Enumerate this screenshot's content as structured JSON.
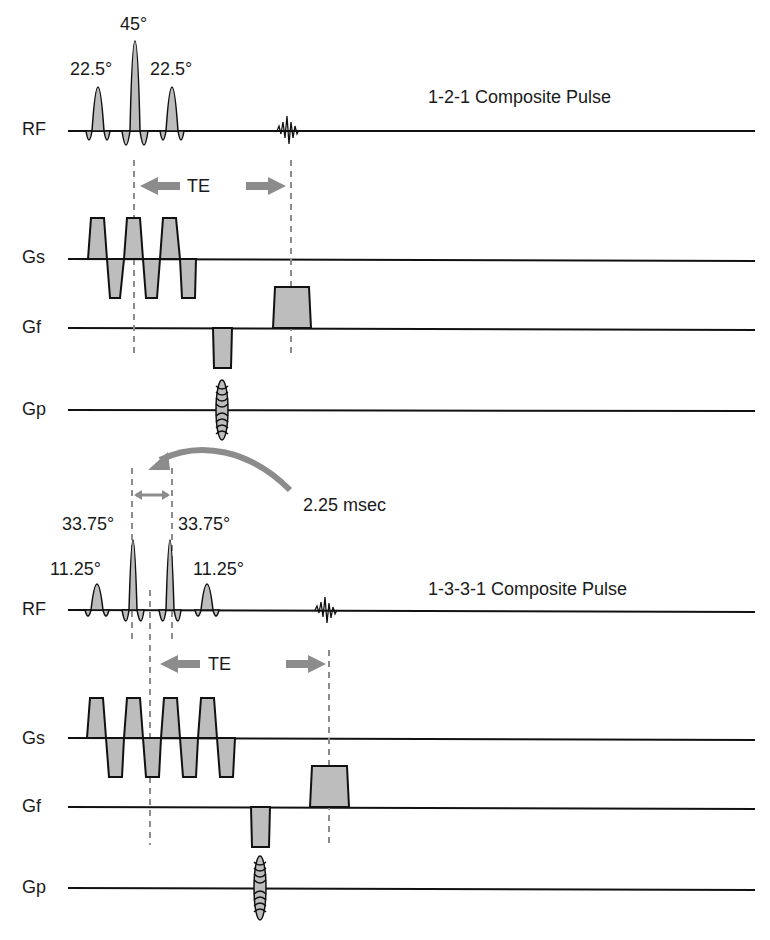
{
  "diagram": {
    "top": {
      "title": "1-2-1 Composite Pulse",
      "axes": [
        "RF",
        "Gs",
        "Gf",
        "Gp"
      ],
      "flip_angles": [
        "22.5°",
        "45°",
        "22.5°"
      ],
      "te_label": "TE"
    },
    "bottom": {
      "title": "1-3-3-1 Composite Pulse",
      "axes": [
        "RF",
        "Gs",
        "Gf",
        "Gp"
      ],
      "flip_angles": [
        "11.25°",
        "33.75°",
        "33.75°",
        "11.25°"
      ],
      "te_label": "TE",
      "interval_label": "2.25 msec"
    },
    "colors": {
      "line": "#111111",
      "fill": "#bdbdbd",
      "arrow": "#8c8c8c",
      "dash": "#8c8c8c"
    }
  }
}
